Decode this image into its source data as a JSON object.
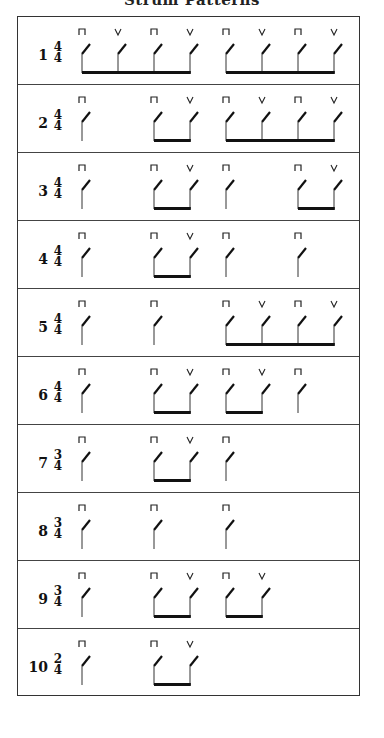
{
  "title": "Strum Patterns",
  "legend": {
    "down_stroke_symbol": "⊓",
    "up_stroke_symbol": "V",
    "down_stroke_icon": "down-bow-icon",
    "up_stroke_icon": "up-bow-icon"
  },
  "layout": {
    "slot_x": [
      64,
      100,
      136,
      172,
      208,
      244,
      280,
      316
    ]
  },
  "patterns": [
    {
      "number": "1",
      "time_signature": {
        "top": "4",
        "bottom": "4"
      },
      "strokes": [
        "down",
        "up",
        "down",
        "up",
        "down",
        "up",
        "down",
        "up"
      ],
      "beams": [
        [
          0,
          3
        ],
        [
          4,
          7
        ]
      ]
    },
    {
      "number": "2",
      "time_signature": {
        "top": "4",
        "bottom": "4"
      },
      "strokes": [
        "down",
        null,
        "down",
        "up",
        "down",
        "up",
        "down",
        "up"
      ],
      "beams": [
        [
          2,
          3
        ],
        [
          4,
          7
        ]
      ]
    },
    {
      "number": "3",
      "time_signature": {
        "top": "4",
        "bottom": "4"
      },
      "strokes": [
        "down",
        null,
        "down",
        "up",
        "down",
        null,
        "down",
        "up"
      ],
      "beams": [
        [
          2,
          3
        ],
        [
          6,
          7
        ]
      ]
    },
    {
      "number": "4",
      "time_signature": {
        "top": "4",
        "bottom": "4"
      },
      "strokes": [
        "down",
        null,
        "down",
        "up",
        "down",
        null,
        "down",
        null
      ],
      "beams": [
        [
          2,
          3
        ]
      ]
    },
    {
      "number": "5",
      "time_signature": {
        "top": "4",
        "bottom": "4"
      },
      "strokes": [
        "down",
        null,
        "down",
        null,
        "down",
        "up",
        "down",
        "up"
      ],
      "beams": [
        [
          4,
          7
        ]
      ]
    },
    {
      "number": "6",
      "time_signature": {
        "top": "4",
        "bottom": "4"
      },
      "strokes": [
        "down",
        null,
        "down",
        "up",
        "down",
        "up",
        "down",
        null
      ],
      "beams": [
        [
          2,
          3
        ],
        [
          4,
          5
        ]
      ]
    },
    {
      "number": "7",
      "time_signature": {
        "top": "3",
        "bottom": "4"
      },
      "strokes": [
        "down",
        null,
        "down",
        "up",
        "down",
        null
      ],
      "beams": [
        [
          2,
          3
        ]
      ]
    },
    {
      "number": "8",
      "time_signature": {
        "top": "3",
        "bottom": "4"
      },
      "strokes": [
        "down",
        null,
        "down",
        null,
        "down",
        null
      ],
      "beams": []
    },
    {
      "number": "9",
      "time_signature": {
        "top": "3",
        "bottom": "4"
      },
      "strokes": [
        "down",
        null,
        "down",
        "up",
        "down",
        "up"
      ],
      "beams": [
        [
          2,
          3
        ],
        [
          4,
          5
        ]
      ]
    },
    {
      "number": "10",
      "time_signature": {
        "top": "2",
        "bottom": "4"
      },
      "strokes": [
        "down",
        null,
        "down",
        "up"
      ],
      "beams": [
        [
          2,
          3
        ]
      ]
    }
  ]
}
